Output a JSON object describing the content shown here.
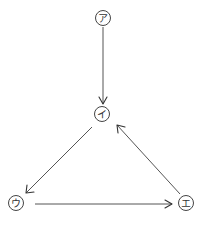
{
  "diagram": {
    "type": "directed-graph",
    "nodes": [
      {
        "id": "a",
        "label": "ア",
        "cx": 103,
        "cy": 18
      },
      {
        "id": "i",
        "label": "イ",
        "cx": 102,
        "cy": 114
      },
      {
        "id": "u",
        "label": "ウ",
        "cx": 16,
        "cy": 203
      },
      {
        "id": "e",
        "label": "エ",
        "cx": 186,
        "cy": 203
      }
    ],
    "edges": [
      {
        "from": "ア",
        "to": "イ"
      },
      {
        "from": "イ",
        "to": "ウ"
      },
      {
        "from": "ウ",
        "to": "エ"
      },
      {
        "from": "エ",
        "to": "イ"
      }
    ],
    "colors": {
      "stroke": "#444444",
      "background": "#ffffff"
    }
  }
}
